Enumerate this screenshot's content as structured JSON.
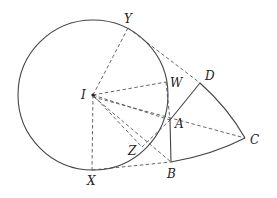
{
  "diagram": {
    "type": "geometry",
    "colors": {
      "stroke": "#444444",
      "dash": "#555555",
      "text": "#222222",
      "background": "#ffffff"
    },
    "circle": {
      "center_label": "I",
      "cx": 93,
      "cy": 95,
      "r": 75
    },
    "points": {
      "I": {
        "label": "I",
        "x": 93,
        "y": 95
      },
      "Y": {
        "label": "Y",
        "x": 128,
        "y": 28
      },
      "W": {
        "label": "W",
        "x": 166,
        "y": 82
      },
      "A": {
        "label": "A",
        "x": 170,
        "y": 120
      },
      "Z": {
        "label": "Z",
        "x": 142,
        "y": 147
      },
      "X": {
        "label": "X",
        "x": 92,
        "y": 170
      },
      "B": {
        "label": "B",
        "x": 171,
        "y": 162
      },
      "C": {
        "label": "C",
        "x": 245,
        "y": 138
      },
      "D": {
        "label": "D",
        "x": 200,
        "y": 83
      }
    },
    "solid_segments": [
      [
        "A",
        "D"
      ],
      [
        "A",
        "B"
      ]
    ],
    "arcs": [
      [
        "D",
        "C"
      ],
      [
        "C",
        "B"
      ]
    ],
    "dashed_segments": [
      [
        "I",
        "Y"
      ],
      [
        "I",
        "W"
      ],
      [
        "I",
        "A"
      ],
      [
        "I",
        "Z"
      ],
      [
        "I",
        "X"
      ],
      [
        "I",
        "B"
      ],
      [
        "I",
        "C"
      ],
      [
        "Y",
        "D"
      ],
      [
        "W",
        "A"
      ],
      [
        "Z",
        "A"
      ],
      [
        "X",
        "B"
      ],
      [
        "A",
        "C"
      ]
    ]
  }
}
